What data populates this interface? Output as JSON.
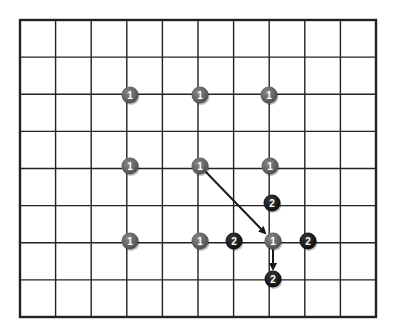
{
  "diagram": {
    "type": "go-board-grid",
    "grid": {
      "columns": 10,
      "rows": 8,
      "left": 20,
      "top": 20,
      "right": 376,
      "bottom": 317,
      "line_color": "#222222",
      "border_width": 2.4,
      "line_width": 1.4
    },
    "colors": {
      "gray_stone": "#5a5a5a",
      "black_stone": "#141414",
      "label": "#ffffff",
      "arrow": "#1a1a1a",
      "background": "#ffffff"
    },
    "stones": [
      {
        "x": 130,
        "y": 95,
        "label": "1",
        "color": "gray"
      },
      {
        "x": 200,
        "y": 95,
        "label": "1",
        "color": "gray"
      },
      {
        "x": 269,
        "y": 95,
        "label": "1",
        "color": "gray"
      },
      {
        "x": 130,
        "y": 166,
        "label": "1",
        "color": "gray"
      },
      {
        "x": 200,
        "y": 166,
        "label": "1",
        "color": "gray"
      },
      {
        "x": 270,
        "y": 166,
        "label": "1",
        "color": "gray"
      },
      {
        "x": 272,
        "y": 203,
        "label": "2",
        "color": "black"
      },
      {
        "x": 130,
        "y": 241,
        "label": "1",
        "color": "gray"
      },
      {
        "x": 200,
        "y": 241,
        "label": "1",
        "color": "gray"
      },
      {
        "x": 234,
        "y": 241,
        "label": "2",
        "color": "black"
      },
      {
        "x": 273,
        "y": 241,
        "label": "1",
        "color": "gray"
      },
      {
        "x": 308,
        "y": 241,
        "label": "2",
        "color": "black"
      },
      {
        "x": 273,
        "y": 279,
        "label": "2",
        "color": "black"
      }
    ],
    "arrows": [
      {
        "from": [
          204,
          170
        ],
        "to": [
          265,
          233
        ]
      },
      {
        "from": [
          273,
          249
        ],
        "to": [
          273,
          269
        ]
      }
    ]
  }
}
